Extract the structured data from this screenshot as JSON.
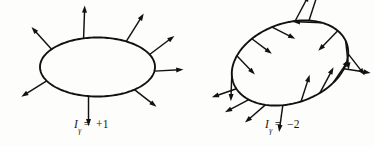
{
  "figure": {
    "background_color": "#fdfdfb",
    "ink_color": "#111111",
    "panels": [
      {
        "id": "left",
        "curve_kind": "ellipse",
        "label": {
          "symbol": "I",
          "subscript": "γ",
          "equals": "=",
          "value": "+1",
          "full_text": "Iγ = +1"
        },
        "curve": {
          "cx": 97.5,
          "cy": 67.0,
          "rx": 57.5,
          "ry": 29.5,
          "rotation_deg": 0
        },
        "vector_count": 8,
        "description": "Closed oval with eight vectors attached around the boundary, all pointing outward; index +1",
        "vectors": [
          {
            "name": "vector-up-left",
            "t_deg": 143,
            "angle_deg": 132,
            "length": 30
          },
          {
            "name": "vector-up",
            "t_deg": 104,
            "angle_deg": 88,
            "length": 33
          },
          {
            "name": "vector-up-right-upper",
            "t_deg": 60,
            "angle_deg": 58,
            "length": 33
          },
          {
            "name": "vector-up-right-lower",
            "t_deg": 25,
            "angle_deg": 37,
            "length": 31
          },
          {
            "name": "vector-right",
            "t_deg": 352,
            "angle_deg": 3,
            "length": 29
          },
          {
            "name": "vector-down-right",
            "t_deg": 310,
            "angle_deg": -38,
            "length": 28
          },
          {
            "name": "vector-down",
            "t_deg": 261,
            "angle_deg": -90,
            "length": 30
          },
          {
            "name": "vector-down-left",
            "t_deg": 208,
            "angle_deg": -148,
            "length": 30
          }
        ]
      },
      {
        "id": "right",
        "curve_kind": "ellipse-tilted",
        "label": {
          "symbol": "I",
          "subscript": "γ",
          "equals": "=",
          "value": "−2",
          "full_text": "Iγ = −2"
        },
        "curve": {
          "cx": 290.0,
          "cy": 63.0,
          "rx": 60.0,
          "ry": 40.0,
          "rotation_deg": -19
        },
        "vector_count": 18,
        "description": "Tilted closed oval with eighteen vectors attached around the boundary, rotating twice in the negative sense; index −2",
        "vectors": [
          {
            "name": "vector-01",
            "t_deg": 168,
            "angle_deg": -92,
            "length": 27
          },
          {
            "name": "vector-02",
            "t_deg": 143,
            "angle_deg": -46,
            "length": 26
          },
          {
            "name": "vector-03",
            "t_deg": 118,
            "angle_deg": -37,
            "length": 25
          },
          {
            "name": "vector-04",
            "t_deg": 95,
            "angle_deg": -27,
            "length": 26
          },
          {
            "name": "vector-05",
            "t_deg": 72,
            "angle_deg": 62,
            "length": 30
          },
          {
            "name": "vector-06",
            "t_deg": 58,
            "angle_deg": 72,
            "length": 32
          },
          {
            "name": "vector-07",
            "t_deg": 44,
            "angle_deg": 178,
            "length": 29
          },
          {
            "name": "vector-08",
            "t_deg": 22,
            "angle_deg": -134,
            "length": 28
          },
          {
            "name": "vector-09",
            "t_deg": 4,
            "angle_deg": -84,
            "length": 29
          },
          {
            "name": "vector-10",
            "t_deg": 345,
            "angle_deg": -52,
            "length": 27
          },
          {
            "name": "vector-11",
            "t_deg": 325,
            "angle_deg": -9,
            "length": 27
          },
          {
            "name": "vector-12",
            "t_deg": 305,
            "angle_deg": 56,
            "length": 28
          },
          {
            "name": "vector-13",
            "t_deg": 288,
            "angle_deg": 62,
            "length": 29
          },
          {
            "name": "vector-14",
            "t_deg": 268,
            "angle_deg": 72,
            "length": 28
          },
          {
            "name": "vector-15",
            "t_deg": 250,
            "angle_deg": -98,
            "length": 27
          },
          {
            "name": "vector-16",
            "t_deg": 232,
            "angle_deg": -139,
            "length": 27
          },
          {
            "name": "vector-17",
            "t_deg": 212,
            "angle_deg": -152,
            "length": 27
          },
          {
            "name": "vector-18",
            "t_deg": 190,
            "angle_deg": -161,
            "length": 26
          }
        ]
      }
    ]
  }
}
